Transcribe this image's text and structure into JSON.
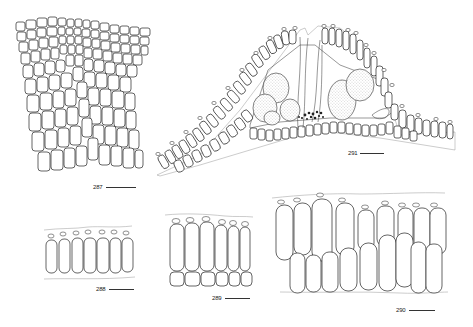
{
  "plate": {
    "type": "botanical line-drawing plate (anatomical cross-sections of cell layers)",
    "background": "#ffffff",
    "ink_color": "#222222"
  },
  "figures": [
    {
      "id": "287",
      "label": "287",
      "description": "Surface view of tissue showing tapering grid of polygonal cells",
      "scale_bar": true
    },
    {
      "id": "288",
      "label": "288",
      "description": "Section with single row of 7 elongate cells, each capped with a small nub",
      "scale_bar": true
    },
    {
      "id": "289",
      "label": "289",
      "description": "Section with row of 6 tall cells above a row of short basal cells, nub-capped",
      "scale_bar": true
    },
    {
      "id": "290",
      "label": "290",
      "description": "Section with two staggered rows of elongate cells, upper row nub-capped (9 cells)",
      "scale_bar": true
    },
    {
      "id": "291",
      "label": "291",
      "description": "Cross-section of conceptacle-like cavity with stippled reproductive bodies and paraphyses, flanked by cell rows",
      "scale_bar": true
    }
  ]
}
